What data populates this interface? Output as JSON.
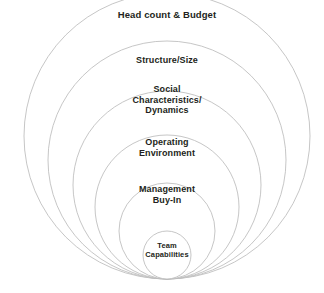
{
  "diagram": {
    "type": "nested-tangent-circles",
    "title": "",
    "background_color": "#ffffff",
    "stroke_color": "#b8b8b8",
    "text_color": "#231f20",
    "canvas": {
      "width": 324,
      "height": 293
    },
    "tangent_point": {
      "x": 167,
      "y": 279
    },
    "layers": [
      {
        "id": "head-count-budget",
        "label": "Head count & Budget",
        "order": 6,
        "scope": "outermost",
        "circle": {
          "cx": 167,
          "cy": 136,
          "r": 143
        },
        "label_pos": {
          "x": 167,
          "y": 15
        },
        "font_size": 9.5
      },
      {
        "id": "structure-size",
        "label": "Structure/Size",
        "order": 5,
        "scope": "outer",
        "circle": {
          "cx": 167,
          "cy": 160,
          "r": 119
        },
        "label_pos": {
          "x": 167,
          "y": 60
        },
        "font_size": 9
      },
      {
        "id": "social-characteristics-dynamics",
        "label": "Social\nCharacteristics/\nDynamics",
        "order": 4,
        "scope": "middle",
        "circle": {
          "cx": 167,
          "cy": 185,
          "r": 94
        },
        "label_pos": {
          "x": 167,
          "y": 100
        },
        "font_size": 9
      },
      {
        "id": "operating-environment",
        "label": "Operating\nEnvironment",
        "order": 3,
        "scope": "middle",
        "circle": {
          "cx": 167,
          "cy": 207,
          "r": 72
        },
        "label_pos": {
          "x": 167,
          "y": 148
        },
        "font_size": 9
      },
      {
        "id": "management-buy-in",
        "label": "Management\nBuy-In",
        "order": 2,
        "scope": "inner",
        "circle": {
          "cx": 167,
          "cy": 231,
          "r": 48
        },
        "label_pos": {
          "x": 167,
          "y": 195
        },
        "font_size": 9
      },
      {
        "id": "team-capabilities",
        "label": "Team\nCapabilities",
        "order": 1,
        "scope": "innermost",
        "circle": {
          "cx": 167,
          "cy": 255,
          "r": 24
        },
        "label_pos": {
          "x": 167,
          "y": 251
        },
        "font_size": 7.5
      }
    ]
  }
}
